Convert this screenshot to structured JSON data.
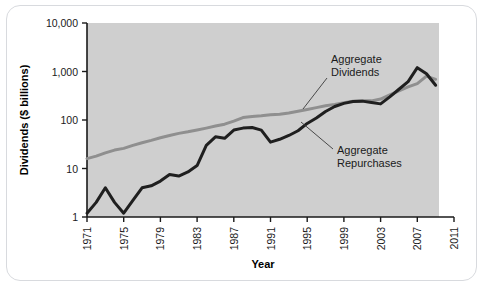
{
  "chart_data": {
    "type": "line",
    "title": "",
    "xlabel": "Year",
    "ylabel": "Dividends ($ billions)",
    "yscale": "log",
    "ylim": [
      1,
      10000
    ],
    "xlim": [
      1971,
      2011
    ],
    "grid": false,
    "plot_background": "#cfcfcf",
    "legend_position": "inline-annotations",
    "y_tick_labels": [
      "10,000",
      "1,000",
      "100",
      "10",
      "1"
    ],
    "y_tick_values": [
      10000,
      1000,
      100,
      10,
      1
    ],
    "x_tick_labels": [
      "1971",
      "1975",
      "1979",
      "1983",
      "1987",
      "1991",
      "1995",
      "1999",
      "2003",
      "2007",
      "2011"
    ],
    "x_tick_values": [
      1971,
      1975,
      1979,
      1983,
      1987,
      1991,
      1995,
      1999,
      2003,
      2007,
      2011
    ],
    "series": [
      {
        "name": "Aggregate Dividends",
        "color": "#8f8f8f",
        "x": [
          1971,
          1972,
          1973,
          1974,
          1975,
          1976,
          1977,
          1978,
          1979,
          1980,
          1981,
          1982,
          1983,
          1984,
          1985,
          1986,
          1987,
          1988,
          1989,
          1990,
          1991,
          1992,
          1993,
          1994,
          1995,
          1996,
          1997,
          1998,
          1999,
          2000,
          2001,
          2002,
          2003,
          2004,
          2005,
          2006,
          2007,
          2008,
          2009
        ],
        "values": [
          16,
          18,
          21,
          24,
          26,
          30,
          34,
          38,
          43,
          48,
          53,
          57,
          62,
          68,
          75,
          82,
          95,
          112,
          118,
          122,
          128,
          132,
          140,
          152,
          165,
          180,
          196,
          210,
          228,
          245,
          250,
          248,
          270,
          330,
          400,
          480,
          560,
          800,
          690
        ]
      },
      {
        "name": "Aggregate Repurchases",
        "color": "#1f1f1f",
        "x": [
          1971,
          1972,
          1973,
          1974,
          1975,
          1976,
          1977,
          1978,
          1979,
          1980,
          1981,
          1982,
          1983,
          1984,
          1985,
          1986,
          1987,
          1988,
          1989,
          1990,
          1991,
          1992,
          1993,
          1994,
          1995,
          1996,
          1997,
          1998,
          1999,
          2000,
          2001,
          2002,
          2003,
          2004,
          2005,
          2006,
          2007,
          2008,
          2009
        ],
        "values": [
          1.2,
          2.0,
          4.0,
          2.0,
          1.2,
          2.2,
          4.0,
          4.4,
          5.5,
          7.5,
          7.0,
          8.5,
          11.5,
          30,
          45,
          42,
          62,
          68,
          70,
          62,
          35,
          40,
          48,
          60,
          85,
          110,
          150,
          190,
          220,
          240,
          245,
          230,
          215,
          300,
          430,
          620,
          1200,
          900,
          520
        ]
      }
    ],
    "annotations": [
      {
        "label_line_1": "Aggregate",
        "label_line_2": "Dividends",
        "text_x": 324,
        "text_y": 57,
        "leader_from_x": 320,
        "leader_from_y": 72,
        "leader_to_x": 296,
        "leader_to_y": 103
      },
      {
        "label_line_1": "Aggregate",
        "label_line_2": "Repurchases",
        "text_x": 330,
        "text_y": 148,
        "leader_from_x": 326,
        "leader_from_y": 143,
        "leader_to_x": 294,
        "leader_to_y": 116
      }
    ]
  }
}
